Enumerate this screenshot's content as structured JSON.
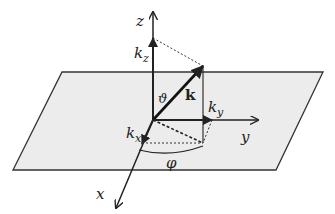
{
  "diagram": {
    "labels": {
      "z": "z",
      "x": "x",
      "y": "y",
      "k": "k",
      "kz_base": "k",
      "kz_sub": "z",
      "ky_base": "k",
      "ky_sub": "y",
      "kx_base": "k",
      "kx_sub": "x",
      "theta": "ϑ",
      "phi": "φ"
    },
    "colors": {
      "plane_fill": "#ececec",
      "line": "#222222"
    }
  }
}
